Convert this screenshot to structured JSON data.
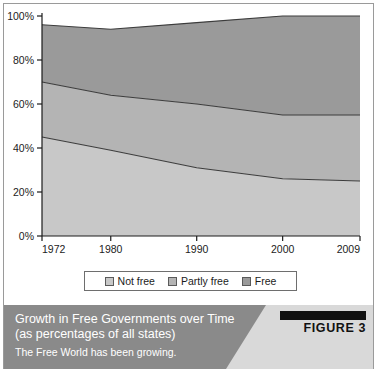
{
  "figure": {
    "badge_label": "FIGURE 3",
    "caption_title_line1": "Growth in Free Governments over Time",
    "caption_title_line2": "(as percentages of all states)",
    "caption_subtitle": "The Free World has been growing."
  },
  "colors": {
    "not_free": "#c8c8c8",
    "partly_free": "#b4b4b4",
    "free": "#9a9a9a",
    "stroke": "#3c3c3c",
    "axis": "#1c1c1c",
    "caption_bar": "#8a8a8a",
    "caption_panel": "#d9d9d9",
    "badge": "#111111"
  },
  "legend": {
    "items": [
      {
        "label": "Not free",
        "color": "#c8c8c8"
      },
      {
        "label": "Partly free",
        "color": "#b4b4b4"
      },
      {
        "label": "Free",
        "color": "#9a9a9a"
      }
    ]
  },
  "chart_data": {
    "type": "area",
    "stacked": true,
    "title": "Growth in Free Governments over Time (as percentages of all states)",
    "xlabel": "",
    "ylabel": "",
    "x": [
      1972,
      1980,
      1990,
      2000,
      2009
    ],
    "categories": [
      "1972",
      "1980",
      "1990",
      "2000",
      "2009"
    ],
    "xtick_labels": [
      "1972",
      "1980",
      "1990",
      "2000",
      "2009"
    ],
    "ytick_labels": [
      "0%",
      "20%",
      "40%",
      "60%",
      "80%",
      "100%"
    ],
    "ytick_values": [
      0,
      20,
      40,
      60,
      80,
      100
    ],
    "ylim": [
      0,
      100
    ],
    "grid": false,
    "legend_position": "bottom",
    "series": [
      {
        "name": "Not free",
        "values": [
          45,
          39,
          31,
          26,
          25
        ]
      },
      {
        "name": "Partly free",
        "values": [
          25,
          25,
          29,
          29,
          30
        ]
      },
      {
        "name": "Free",
        "values": [
          26,
          30,
          37,
          45,
          45
        ]
      }
    ],
    "cumulative_boundaries": {
      "not_free_top": [
        45,
        39,
        31,
        26,
        25
      ],
      "partly_free_top": [
        70,
        64,
        60,
        55,
        55
      ],
      "free_top": [
        96,
        98,
        99,
        100,
        100
      ]
    }
  }
}
